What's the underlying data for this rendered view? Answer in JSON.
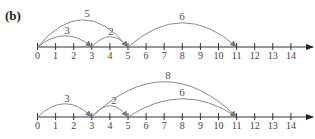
{
  "panel_label": "(b)",
  "number_line": {
    "min": 0,
    "max": 14,
    "ticks": [
      "0",
      "1",
      "2",
      "3",
      "4",
      "5",
      "6",
      "7",
      "8",
      "9",
      "10",
      "11",
      "12",
      "13",
      "14"
    ]
  },
  "diagrams": [
    {
      "name": "top",
      "jumps": [
        {
          "from": 0,
          "to": 3,
          "label": "3"
        },
        {
          "from": 3,
          "to": 5,
          "label": "2"
        },
        {
          "from": 0,
          "to": 5,
          "label": "5"
        },
        {
          "from": 5,
          "to": 11,
          "label": "6"
        }
      ]
    },
    {
      "name": "bottom",
      "jumps": [
        {
          "from": 0,
          "to": 3,
          "label": "3"
        },
        {
          "from": 3,
          "to": 5,
          "label": "2"
        },
        {
          "from": 3,
          "to": 11,
          "label": "8"
        },
        {
          "from": 5,
          "to": 11,
          "label": "6"
        }
      ]
    }
  ],
  "colors": {
    "axis": "#333333",
    "arc": "#8a8a8a",
    "text": "#444444"
  }
}
